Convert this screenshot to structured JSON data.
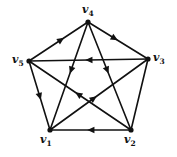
{
  "figure": {
    "name": "directed-pentagram-graph",
    "background_color": "#ffffff",
    "edge_color": "#111111",
    "vertex_color": "#111111",
    "label_color": "#111111",
    "edge_width": 1.6,
    "vertex_radius": 2.6
  },
  "vertices": [
    {
      "id": "v1",
      "label": "v",
      "sub": "1",
      "x": 50,
      "y": 130,
      "label_x": 40,
      "label_y": 134
    },
    {
      "id": "v2",
      "label": "v",
      "sub": "2",
      "x": 131,
      "y": 130,
      "label_x": 124,
      "label_y": 134
    },
    {
      "id": "v3",
      "label": "v",
      "sub": "3",
      "x": 148,
      "y": 59,
      "label_x": 153,
      "label_y": 52
    },
    {
      "id": "v4",
      "label": "v",
      "sub": "4",
      "x": 88,
      "y": 22,
      "label_x": 82,
      "label_y": 4
    },
    {
      "id": "v5",
      "label": "v",
      "sub": "5",
      "x": 29,
      "y": 61,
      "label_x": 12,
      "label_y": 54
    }
  ],
  "edges": [
    {
      "id": "e-v5-v4",
      "from": "v5",
      "to": "v4",
      "kind": "pentagon-side",
      "arrow_at": 0.55,
      "arrow_dir": "to"
    },
    {
      "id": "e-v4-v3",
      "from": "v4",
      "to": "v3",
      "kind": "pentagon-side",
      "arrow_at": 0.45,
      "arrow_dir": "to"
    },
    {
      "id": "e-v3-v5",
      "from": "v3",
      "to": "v5",
      "kind": "pentagon-chord",
      "arrow_at": 0.5,
      "arrow_dir": "to"
    },
    {
      "id": "e-v5-v1",
      "from": "v5",
      "to": "v1",
      "kind": "pentagon-side",
      "arrow_at": 0.52,
      "arrow_dir": "to"
    },
    {
      "id": "e-v2-v1",
      "from": "v2",
      "to": "v1",
      "kind": "pentagon-side",
      "arrow_at": 0.5,
      "arrow_dir": "to"
    },
    {
      "id": "e-v3-v2",
      "from": "v3",
      "to": "v2",
      "kind": "pentagon-side",
      "arrow_at": 0.5,
      "arrow_dir": "none"
    },
    {
      "id": "e-v4-v1",
      "from": "v4",
      "to": "v1",
      "kind": "diagonal",
      "arrow_at": 0.45,
      "arrow_dir": "to"
    },
    {
      "id": "e-v4-v2",
      "from": "v4",
      "to": "v2",
      "kind": "diagonal",
      "arrow_at": 0.45,
      "arrow_dir": "to"
    },
    {
      "id": "e-v1-v3",
      "from": "v1",
      "to": "v3",
      "kind": "diagonal",
      "arrow_at": 0.45,
      "arrow_dir": "to"
    },
    {
      "id": "e-v2-v5",
      "from": "v2",
      "to": "v5",
      "kind": "diagonal",
      "arrow_at": 0.52,
      "arrow_dir": "to"
    }
  ],
  "chart_data": {
    "type": "diagram",
    "title": "",
    "graph_kind": "directed graph on 5 vertices (pentagon + pentagram)",
    "vertex_count": 5,
    "edge_count": 10,
    "vertex_labels": [
      "v1",
      "v2",
      "v3",
      "v4",
      "v5"
    ],
    "directed_edges": [
      [
        "v5",
        "v4"
      ],
      [
        "v4",
        "v3"
      ],
      [
        "v3",
        "v5"
      ],
      [
        "v5",
        "v1"
      ],
      [
        "v2",
        "v1"
      ],
      [
        "v3",
        "v2"
      ],
      [
        "v4",
        "v1"
      ],
      [
        "v4",
        "v2"
      ],
      [
        "v1",
        "v3"
      ],
      [
        "v2",
        "v5"
      ]
    ]
  }
}
